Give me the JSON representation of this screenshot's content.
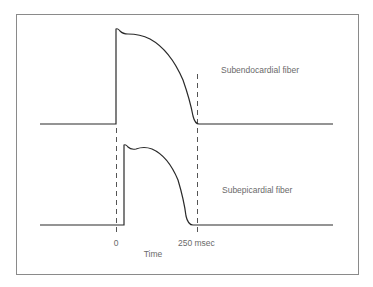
{
  "diagram": {
    "traces": [
      {
        "id": "subendocardial",
        "label": "Subendocardial fiber",
        "baseline_y": 124,
        "upstroke_x": 116,
        "path": "M40,124 L116,124 L116,29 Q118,28 120,31 Q123,34 128,34 Q140,34 150,39 Q170,50 183,80 Q190,100 193,116 Q195,124 199,124 L333,124"
      },
      {
        "id": "subepicardial",
        "label": "Subepicardial fiber",
        "baseline_y": 225,
        "upstroke_x": 124,
        "path": "M40,225 L124,225 L124,145 Q126,144 128,147 Q131,150 136,149 Q144,146 152,149 Q168,156 178,180 Q184,200 186,216 Q188,225 193,225 L333,225"
      }
    ],
    "markers": [
      {
        "x": 116,
        "tick_label": "0"
      },
      {
        "x": 197,
        "tick_label": "250 msec"
      }
    ],
    "axis_label": "Time",
    "colors": {
      "trace": "#2a2a2a",
      "dashed": "#555555",
      "frame": "#8a8a8a",
      "text": "#6a6a6a"
    }
  }
}
